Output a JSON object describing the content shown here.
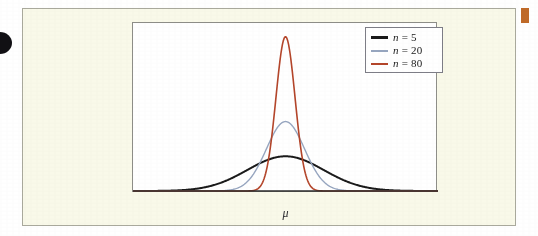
{
  "figure": {
    "background_color": "#f9f9e9",
    "panel_color": "#ffffff",
    "border_color": "#a9a99c",
    "axis_label": "μ"
  },
  "artifacts": {
    "left_blob_color": "#111014",
    "right_tab_color": "#c06a28"
  },
  "legend": {
    "entries": [
      {
        "label_prefix": "n",
        "label_rest": " = 5",
        "color": "#1a1a1a",
        "weight": "thick"
      },
      {
        "label_prefix": "n",
        "label_rest": " = 20",
        "color": "#97a6c0",
        "weight": "thin"
      },
      {
        "label_prefix": "n",
        "label_rest": " = 80",
        "color": "#b4452a",
        "weight": "thin"
      }
    ]
  },
  "chart_data": {
    "type": "line",
    "title": "",
    "subtitle": "",
    "xlabel": "μ",
    "ylabel": "",
    "grid": false,
    "legend_position": "top-right",
    "x_center_label": "μ",
    "axis_ranges": {
      "x": [
        -4,
        4
      ],
      "y": [
        0,
        1
      ]
    },
    "series": [
      {
        "name": "n = 5",
        "color": "#1a1a1a",
        "line_width": 2.0,
        "sigma": 1.0,
        "peak_height": 0.18,
        "x": [
          -4.0,
          -3.5,
          -3.0,
          -2.5,
          -2.0,
          -1.5,
          -1.0,
          -0.5,
          0.0,
          0.5,
          1.0,
          1.5,
          2.0,
          2.5,
          3.0,
          3.5,
          4.0
        ],
        "y": [
          0.001,
          0.005,
          0.02,
          0.055,
          0.024,
          0.105,
          0.147,
          0.174,
          0.18,
          0.174,
          0.147,
          0.105,
          0.064,
          0.033,
          0.02,
          0.005,
          0.001
        ]
      },
      {
        "name": "n = 20",
        "color": "#97a6c0",
        "line_width": 1.4,
        "sigma": 0.5,
        "peak_height": 0.36,
        "x": [
          -2.0,
          -1.75,
          -1.5,
          -1.25,
          -1.0,
          -0.75,
          -0.5,
          -0.25,
          0.0,
          0.25,
          0.5,
          0.75,
          1.0,
          1.25,
          1.5,
          1.75,
          2.0
        ],
        "y": [
          0.001,
          0.005,
          0.013,
          0.029,
          0.06,
          0.116,
          0.196,
          0.296,
          0.36,
          0.296,
          0.196,
          0.116,
          0.06,
          0.029,
          0.013,
          0.005,
          0.001
        ]
      },
      {
        "name": "n = 80",
        "color": "#b4452a",
        "line_width": 1.6,
        "sigma": 0.25,
        "peak_height": 0.8,
        "x": [
          -1.0,
          -0.875,
          -0.75,
          -0.625,
          -0.5,
          -0.375,
          -0.25,
          -0.125,
          0.0,
          0.125,
          0.25,
          0.375,
          0.5,
          0.625,
          0.75,
          0.875,
          1.0
        ],
        "y": [
          0.001,
          0.004,
          0.012,
          0.035,
          0.088,
          0.198,
          0.39,
          0.66,
          0.8,
          0.66,
          0.39,
          0.198,
          0.088,
          0.035,
          0.012,
          0.004,
          0.001
        ]
      }
    ]
  }
}
